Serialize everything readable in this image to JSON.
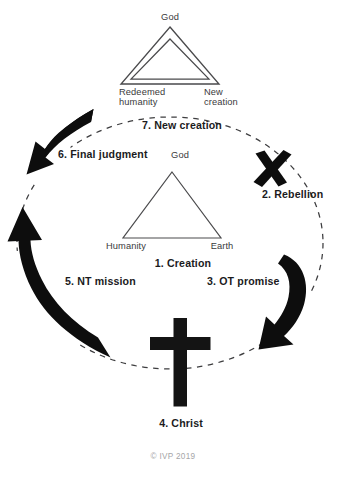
{
  "diagram": {
    "title_text": "Biblical narrative cycle",
    "copyright": "© IVP 2019",
    "colors": {
      "ink": "#231f20",
      "line": "#4a4a4c",
      "solid": "#0d0d0d",
      "faint": "#a6a6a8",
      "background": "#ffffff"
    },
    "top_triangle": {
      "style": "double-outline",
      "apex_label": "God",
      "left_label": "Redeemed\nhumanity",
      "right_label": "New\ncreation"
    },
    "center_triangle": {
      "style": "single-outline",
      "apex_label": "God",
      "left_label": "Humanity",
      "right_label": "Earth"
    },
    "stages": [
      {
        "id": "creation",
        "label": "1. Creation"
      },
      {
        "id": "rebellion",
        "label": "2. Rebellion"
      },
      {
        "id": "ot-promise",
        "label": "3. OT promise"
      },
      {
        "id": "christ",
        "label": "4. Christ"
      },
      {
        "id": "nt-mission",
        "label": "5. NT mission"
      },
      {
        "id": "final-judgment",
        "label": "6. Final judgment"
      },
      {
        "id": "new-creation",
        "label": "7. New creation"
      }
    ],
    "symbols": [
      {
        "id": "rebellion-x",
        "name": "x-mark-icon",
        "meaning": "Rebellion"
      },
      {
        "id": "christ-cross",
        "name": "cross-icon",
        "meaning": "Christ"
      }
    ],
    "cycle": {
      "path": "dashed-circle",
      "direction": "clockwise",
      "arrow_count": 3
    }
  }
}
